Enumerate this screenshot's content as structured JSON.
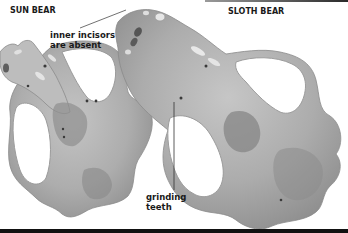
{
  "figure": {
    "labels": {
      "sun_bear": "SUN BEAR",
      "sloth_bear": "SLOTH BEAR",
      "incisors_line1": "inner incisors",
      "incisors_line2": "are absent",
      "grinding_line1": "grinding",
      "grinding_line2": "teeth"
    },
    "colors": {
      "bone_light": "#c9c9c9",
      "bone_mid": "#a9a9a9",
      "bone_dark": "#7d7d7d",
      "text": "#1a1a1a",
      "rule": "#111111"
    }
  }
}
